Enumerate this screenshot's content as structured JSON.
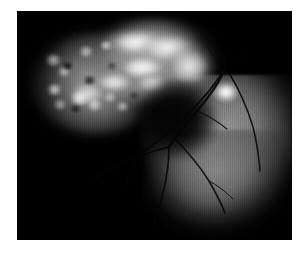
{
  "figure": {
    "kind": "retinal-fluorescein-angiogram",
    "modality_label": "Fluorescein angiography",
    "caption": "",
    "page_background": "#ffffff",
    "plate_background": "#000000",
    "plate": {
      "x": 17,
      "y": 11,
      "width": 275,
      "height": 229
    }
  },
  "palette": {
    "background_white": "#ffffff",
    "plate_black": "#000000",
    "hyperfluorescence_white": "#ffffff",
    "fundus_gray": "#7e7e7e",
    "vessel_dark": "#0a0a0a",
    "optic_disc": "#f2f2f2"
  },
  "regions": [
    {
      "name": "hyperfluorescent-lesion",
      "label": "Hyperfluorescent leakage",
      "description": "Large bright cloudy arching lesion occupying the upper-left and upper-centre of the plate",
      "brightness": "high",
      "center_pct": {
        "x": 36,
        "y": 28
      }
    },
    {
      "name": "mottled-margin",
      "label": "Mottled granular margin",
      "description": "Speckled stippled hyperfluorescence along the left flank of the lesion",
      "brightness": "medium",
      "center_pct": {
        "x": 18,
        "y": 38
      }
    },
    {
      "name": "dark-notch",
      "label": "Hypofluorescent notch",
      "description": "Dark concave hollow separating the lesion from the lower fundus",
      "brightness": "low",
      "center_pct": {
        "x": 56,
        "y": 48
      }
    },
    {
      "name": "fundus-field",
      "label": "Illuminated fundus",
      "description": "Gray retinal background filling the lower-right quadrant",
      "brightness": "medium",
      "center_pct": {
        "x": 70,
        "y": 68
      }
    },
    {
      "name": "optic-disc",
      "label": "Optic disc",
      "description": "Small intensely bright spot at the upper-right margin of the fundus field",
      "brightness": "very high",
      "center_pct": {
        "x": 76,
        "y": 35
      }
    }
  ],
  "vessels": {
    "label": "Retinal vascular tree",
    "appearance": "dark branching lines silhouetted against the gray fundus",
    "branch_count": 9
  },
  "artifacts": {
    "scanlines": "vertical digitisation striping across the whole plate",
    "grain": "photographic film grain"
  }
}
